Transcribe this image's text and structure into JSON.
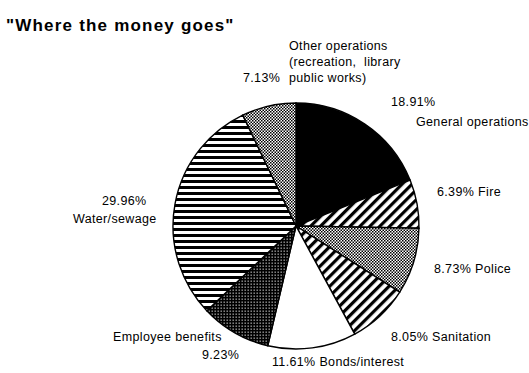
{
  "title": "\"Where the money goes\"",
  "chart_data": {
    "type": "pie",
    "title": "\"Where the money goes\"",
    "xlabel": "",
    "ylabel": "",
    "legend_position": "none",
    "grid": false,
    "start_angle_deg": 0,
    "direction": "clockwise",
    "center": {
      "x": 296,
      "y": 226
    },
    "radius": 123,
    "categories": [
      "General operations",
      "Fire",
      "Police",
      "Sanitation",
      "Bonds/interest",
      "Employee benefits",
      "Water/sewage",
      "Other operations (recreation, library public works)"
    ],
    "values": [
      18.91,
      6.39,
      8.73,
      8.05,
      11.61,
      9.23,
      29.96,
      7.13
    ],
    "slices": [
      {
        "label": "General operations",
        "percent": 18.91,
        "percent_text": "18.91%",
        "fill": "solid-black",
        "color": "#000000"
      },
      {
        "label": "Fire",
        "percent": 6.39,
        "percent_text": "6.39%",
        "fill": "diagonal-hatch",
        "color": "#000000"
      },
      {
        "label": "Police",
        "percent": 8.73,
        "percent_text": "8.73%",
        "fill": "gray-stipple",
        "color": "#7a7a7a"
      },
      {
        "label": "Sanitation",
        "percent": 8.05,
        "percent_text": "8.05%",
        "fill": "diagonal-hatch",
        "color": "#000000"
      },
      {
        "label": "Bonds/interest",
        "percent": 11.61,
        "percent_text": "11.61%",
        "fill": "white",
        "color": "#ffffff"
      },
      {
        "label": "Employee benefits",
        "percent": 9.23,
        "percent_text": "9.23%",
        "fill": "dark-stipple",
        "color": "#333333"
      },
      {
        "label": "Water/sewage",
        "percent": 29.96,
        "percent_text": "29.96%",
        "fill": "horizontal-lines",
        "color": "#000000"
      },
      {
        "label": "Other operations",
        "percent": 7.13,
        "percent_text": "7.13%",
        "fill": "gray-stipple",
        "color": "#8a8a8a"
      }
    ]
  },
  "labels": {
    "other_operations_text": "Other operations\n(recreation,  library\npublic works)",
    "other_operations_pct": "7.13%",
    "general_operations_pct": "18.91%",
    "general_operations_text": "General operations",
    "fire": "6.39%  Fire",
    "police": "8.73%   Police",
    "sanitation": "8.05%  Sanitation",
    "bonds": "11.61%   Bonds/interest",
    "employee_benefits_text": "Employee benefits",
    "employee_benefits_pct": "9.23%",
    "water_sewage_pct": "29.96%",
    "water_sewage_text": "Water/sewage"
  },
  "colors": {
    "background": "#ffffff",
    "foreground": "#000000",
    "gray_fill": "#7f7f7f",
    "dark_fill": "#2e2e2e"
  }
}
